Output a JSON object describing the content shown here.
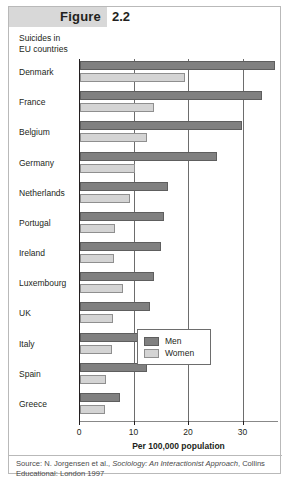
{
  "figure": {
    "label": "Figure",
    "number": "2.2"
  },
  "subtitle_line1": "Suicides in",
  "subtitle_line2": "EU countries",
  "source": {
    "prefix": "Source: N. Jorgensen et al., ",
    "italic": "Sociology: An Interactionist Approach",
    "suffix": ", Collins Educational: London 1997"
  },
  "legend": {
    "men": "Men",
    "women": "Women"
  },
  "colors": {
    "men": "#808080",
    "women": "#d4d4d4",
    "header_band": "#d8d8d8",
    "gridline": "#6d6d6d",
    "text": "#231f20"
  },
  "chart_data": {
    "type": "bar",
    "orientation": "horizontal",
    "title": "Suicides in EU countries",
    "xlabel": "Per 100,000 population",
    "ylabel": "",
    "xlim": [
      0,
      36.5
    ],
    "ticks": [
      0,
      10,
      20,
      30
    ],
    "tick_labels": [
      "0",
      "10",
      "20",
      "30"
    ],
    "grid": true,
    "legend_position": "center-right",
    "categories": [
      "Denmark",
      "France",
      "Belgium",
      "Germany",
      "Netherlands",
      "Portugal",
      "Ireland",
      "Luxembourg",
      "UK",
      "Italy",
      "Spain",
      "Greece"
    ],
    "series": [
      {
        "name": "Men",
        "values": [
          35.8,
          33.3,
          29.8,
          25.2,
          16.2,
          15.4,
          14.8,
          13.6,
          12.9,
          12.6,
          12.2,
          7.3
        ]
      },
      {
        "name": "Women",
        "values": [
          19.2,
          13.6,
          12.3,
          10.0,
          9.2,
          6.5,
          6.2,
          7.8,
          6.0,
          5.8,
          4.8,
          4.6
        ]
      }
    ]
  }
}
